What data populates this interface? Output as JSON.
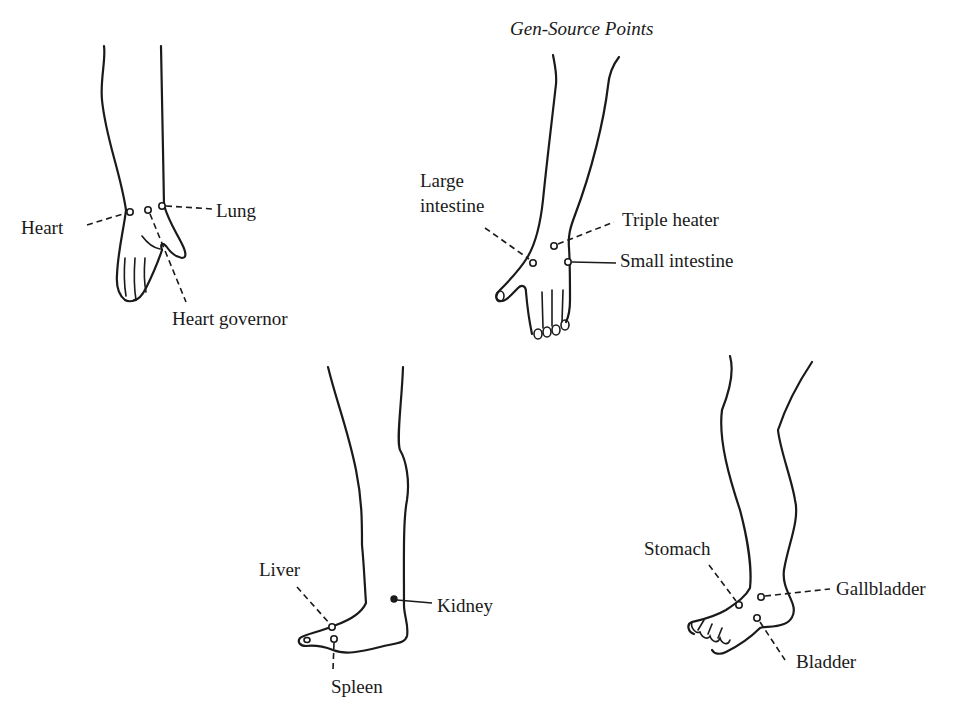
{
  "title": "Gen-Source Points",
  "figures": [
    {
      "id": "hand-palm",
      "limb": "forearm and hand (palm view)",
      "points": [
        {
          "label": "Heart"
        },
        {
          "label": "Lung"
        },
        {
          "label": "Heart governor"
        }
      ]
    },
    {
      "id": "hand-back",
      "limb": "forearm and hand (back view)",
      "points": [
        {
          "label_line1": "Large",
          "label_line2": "intestine"
        },
        {
          "label": "Triple heater"
        },
        {
          "label": "Small intestine"
        }
      ]
    },
    {
      "id": "foot-medial",
      "limb": "leg and foot (medial view)",
      "points": [
        {
          "label": "Liver"
        },
        {
          "label": "Kidney"
        },
        {
          "label": "Spleen"
        }
      ]
    },
    {
      "id": "foot-lateral",
      "limb": "leg and foot (lateral view)",
      "points": [
        {
          "label": "Stomach"
        },
        {
          "label": "Gallbladder"
        },
        {
          "label": "Bladder"
        }
      ]
    }
  ],
  "colors": {
    "ink": "#1a1a1a",
    "paper": "#ffffff"
  }
}
